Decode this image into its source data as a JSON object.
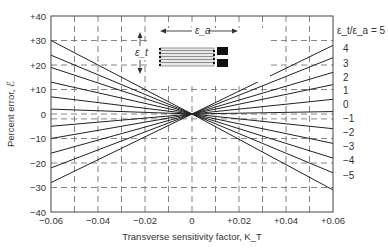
{
  "chart_data": {
    "type": "line",
    "title": "",
    "xlabel": "Transverse sensitivity factor, K_T",
    "ylabel": "Percent error, ℰ",
    "xlim": [
      -0.06,
      0.06
    ],
    "ylim": [
      -40,
      40
    ],
    "x_ticks": [
      "−0.06",
      "−0.04",
      "−0.02",
      "0",
      "+0.02",
      "+0.04",
      "+0.06"
    ],
    "y_ticks": [
      "+40",
      "+30",
      "+20",
      "+10",
      "0",
      "−10",
      "−20",
      "−30",
      "−40"
    ],
    "grid": true,
    "legend_title": "ε_t/ε_a = 5",
    "x": [
      -0.06,
      0,
      0.06
    ],
    "series": [
      {
        "name": "5",
        "values": [
          -28,
          0,
          28
        ]
      },
      {
        "name": "4",
        "values": [
          -22,
          0,
          23
        ]
      },
      {
        "name": "3",
        "values": [
          -16,
          0,
          17
        ]
      },
      {
        "name": "2",
        "values": [
          -10,
          0,
          12
        ]
      },
      {
        "name": "1",
        "values": [
          -5,
          0,
          6
        ]
      },
      {
        "name": "0",
        "values": [
          2,
          0,
          1
        ]
      },
      {
        "name": "-1",
        "values": [
          7,
          0,
          -6
        ]
      },
      {
        "name": "-2",
        "values": [
          13,
          0,
          -12
        ]
      },
      {
        "name": "-3",
        "values": [
          19,
          0,
          -18
        ]
      },
      {
        "name": "-4",
        "values": [
          24,
          0,
          -24
        ]
      },
      {
        "name": "-5",
        "values": [
          30,
          0,
          -31
        ]
      }
    ],
    "series_labels": [
      "ε_t/ε_a = 5",
      "4",
      "3",
      "2",
      "1",
      "0",
      "−1",
      "−2",
      "−3",
      "−4",
      "−5"
    ],
    "annotation": {
      "axial_strain_label": "ε_a",
      "transverse_strain_label": "ε_t",
      "inset": "strain-gauge-grid-diagram"
    }
  }
}
